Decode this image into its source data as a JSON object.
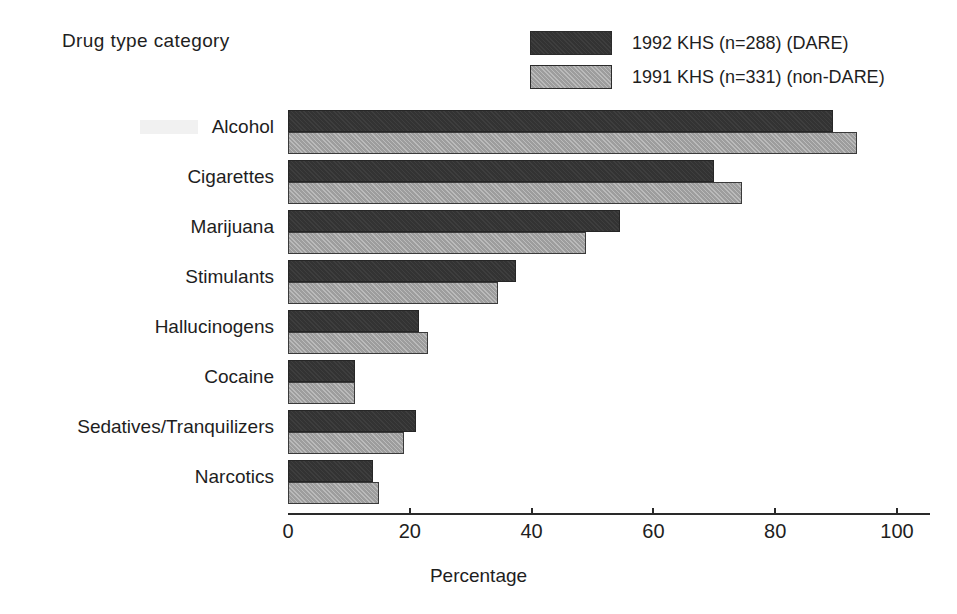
{
  "figure": {
    "y_axis_title": "Drug type category",
    "x_axis_title": "Percentage"
  },
  "legend": {
    "items": [
      {
        "label": "1992 KHS (n=288) (DARE)",
        "swatch": "dark-swatch",
        "color": "#333333"
      },
      {
        "label": "1991 KHS (n=331) (non-DARE)",
        "swatch": "light-swatch",
        "color": "#9d9d9d"
      }
    ]
  },
  "axis": {
    "ticks": [
      {
        "label": "0",
        "value": 0
      },
      {
        "label": "20",
        "value": 20
      },
      {
        "label": "40",
        "value": 40
      },
      {
        "label": "60",
        "value": 60
      },
      {
        "label": "80",
        "value": 80
      },
      {
        "label": "100",
        "value": 100
      }
    ]
  },
  "chart_data": {
    "type": "bar",
    "orientation": "horizontal",
    "title": "",
    "xlabel": "Percentage",
    "ylabel": "Drug type category",
    "xlim": [
      0,
      100
    ],
    "grid": false,
    "legend_position": "top-right",
    "categories": [
      "Alcohol",
      "Cigarettes",
      "Marijuana",
      "Stimulants",
      "Hallucinogens",
      "Cocaine",
      "Sedatives/Tranquilizers",
      "Narcotics"
    ],
    "series": [
      {
        "name": "1992 KHS (n=288) (DARE)",
        "color": "#333333",
        "values": [
          89.5,
          70.0,
          54.5,
          37.5,
          21.5,
          11.0,
          21.0,
          14.0
        ]
      },
      {
        "name": "1991 KHS (n=331) (non-DARE)",
        "color": "#9d9d9d",
        "values": [
          93.5,
          74.5,
          49.0,
          34.5,
          23.0,
          11.0,
          19.0,
          15.0
        ]
      }
    ]
  }
}
